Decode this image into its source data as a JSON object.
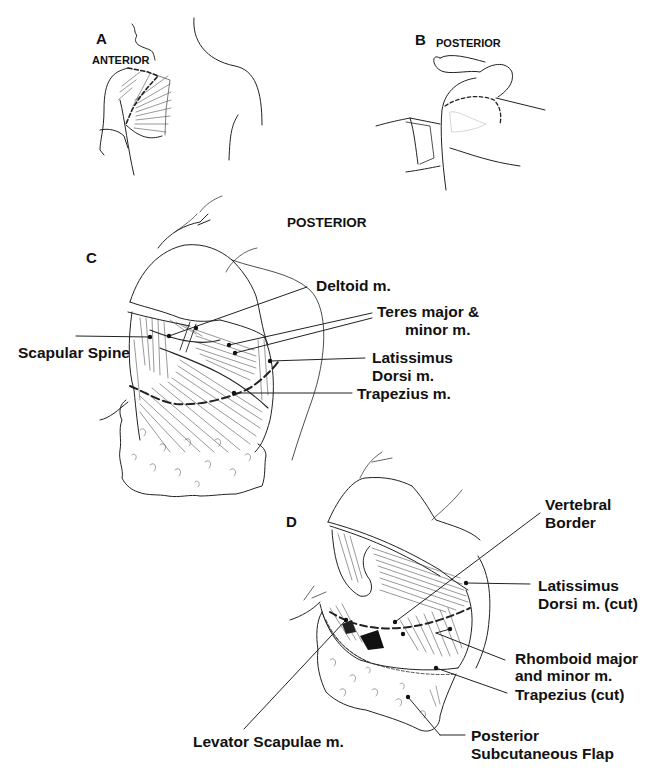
{
  "figure": {
    "panels": [
      {
        "id": "A",
        "letter": "A",
        "view": "ANTERIOR"
      },
      {
        "id": "B",
        "letter": "B",
        "view": "POSTERIOR"
      },
      {
        "id": "C",
        "letter": "C",
        "view": "POSTERIOR"
      },
      {
        "id": "D",
        "letter": "D",
        "view": ""
      }
    ],
    "panel_c_labels": {
      "deltoid": "Deltoid m.",
      "teres_1": "Teres major &",
      "teres_2": "minor m.",
      "scapular_spine": "Scapular Spine",
      "latissimus_1": "Latissimus",
      "latissimus_2": "Dorsi m.",
      "trapezius": "Trapezius m."
    },
    "panel_d_labels": {
      "vertebral_1": "Vertebral",
      "vertebral_2": "Border",
      "latissimus_cut_1": "Latissimus",
      "latissimus_cut_2": "Dorsi m. (cut)",
      "rhomboid_1": "Rhomboid major",
      "rhomboid_2": "and minor m.",
      "trapezius_cut": "Trapezius (cut)",
      "levator": "Levator Scapulae m.",
      "flap_1": "Posterior",
      "flap_2": "Subcutaneous Flap"
    }
  }
}
